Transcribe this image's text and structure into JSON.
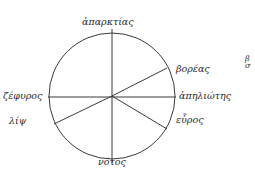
{
  "diagram": {
    "type": "wind-rose",
    "stroke_color": "#3a3a3a",
    "center": {
      "x": 112,
      "y": 96
    },
    "radius": 63,
    "labels": {
      "north": "ἀπαρκτίας",
      "northeast": "βορέας",
      "east": "ἀπηλιώτης",
      "southeast": "εὖρος",
      "south": "νότος",
      "west": "ζέφυρος",
      "southwest": "λίψ"
    },
    "margin_fragment": "β σ"
  }
}
